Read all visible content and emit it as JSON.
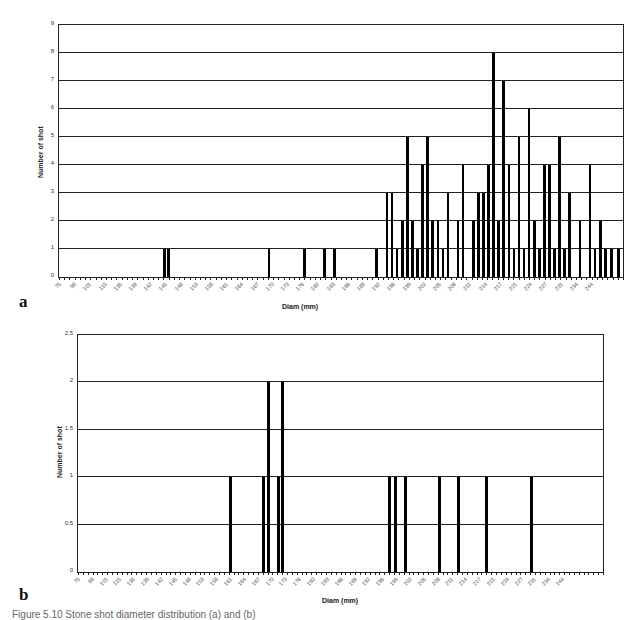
{
  "figure": {
    "caption": "Figure 5.10 Stone shot diameter distribution (a) and (b)"
  },
  "chart_data": [
    {
      "panel": "a",
      "type": "bar",
      "title": "",
      "xlabel": "Diam (mm)",
      "ylabel": "Number of shot",
      "ylim": [
        0,
        9
      ],
      "yticks": [
        "0",
        "1",
        "2",
        "3",
        "4",
        "5",
        "6",
        "7",
        "8",
        "9"
      ],
      "grid": true,
      "xtick_labels": [
        "75",
        "98",
        "101",
        "115",
        "135",
        "139",
        "142",
        "145",
        "148",
        "153",
        "158",
        "161",
        "164",
        "167",
        "170",
        "173",
        "176",
        "180",
        "183",
        "186",
        "189",
        "192",
        "196",
        "199",
        "202",
        "205",
        "208",
        "211",
        "214",
        "217",
        "221",
        "224",
        "227",
        "231",
        "234",
        "244"
      ],
      "bars": [
        {
          "pos": 0.187,
          "value": 1
        },
        {
          "pos": 0.195,
          "value": 1
        },
        {
          "pos": 0.373,
          "value": 1
        },
        {
          "pos": 0.436,
          "value": 1
        },
        {
          "pos": 0.471,
          "value": 1
        },
        {
          "pos": 0.489,
          "value": 1
        },
        {
          "pos": 0.563,
          "value": 1
        },
        {
          "pos": 0.582,
          "value": 3
        },
        {
          "pos": 0.591,
          "value": 3
        },
        {
          "pos": 0.6,
          "value": 1
        },
        {
          "pos": 0.609,
          "value": 2
        },
        {
          "pos": 0.618,
          "value": 5
        },
        {
          "pos": 0.627,
          "value": 2
        },
        {
          "pos": 0.636,
          "value": 1
        },
        {
          "pos": 0.645,
          "value": 4
        },
        {
          "pos": 0.654,
          "value": 5
        },
        {
          "pos": 0.663,
          "value": 2
        },
        {
          "pos": 0.672,
          "value": 2
        },
        {
          "pos": 0.681,
          "value": 1
        },
        {
          "pos": 0.69,
          "value": 3
        },
        {
          "pos": 0.708,
          "value": 2
        },
        {
          "pos": 0.717,
          "value": 4
        },
        {
          "pos": 0.735,
          "value": 2
        },
        {
          "pos": 0.744,
          "value": 3
        },
        {
          "pos": 0.753,
          "value": 3
        },
        {
          "pos": 0.762,
          "value": 4
        },
        {
          "pos": 0.771,
          "value": 8
        },
        {
          "pos": 0.78,
          "value": 2
        },
        {
          "pos": 0.789,
          "value": 7
        },
        {
          "pos": 0.798,
          "value": 4
        },
        {
          "pos": 0.807,
          "value": 1
        },
        {
          "pos": 0.816,
          "value": 5
        },
        {
          "pos": 0.825,
          "value": 1
        },
        {
          "pos": 0.834,
          "value": 6
        },
        {
          "pos": 0.843,
          "value": 2
        },
        {
          "pos": 0.852,
          "value": 1
        },
        {
          "pos": 0.861,
          "value": 4
        },
        {
          "pos": 0.87,
          "value": 4
        },
        {
          "pos": 0.879,
          "value": 1
        },
        {
          "pos": 0.888,
          "value": 5
        },
        {
          "pos": 0.897,
          "value": 1
        },
        {
          "pos": 0.906,
          "value": 3
        },
        {
          "pos": 0.924,
          "value": 2
        },
        {
          "pos": 0.942,
          "value": 4
        },
        {
          "pos": 0.951,
          "value": 1
        },
        {
          "pos": 0.96,
          "value": 2
        },
        {
          "pos": 0.969,
          "value": 1
        },
        {
          "pos": 0.98,
          "value": 1
        },
        {
          "pos": 0.992,
          "value": 1
        }
      ]
    },
    {
      "panel": "b",
      "type": "bar",
      "title": "",
      "xlabel": "Diam (mm)",
      "ylabel": "Number of shot",
      "ylim": [
        0,
        2.5
      ],
      "yticks": [
        "0",
        "0.5",
        "1",
        "1.5",
        "2",
        "2.5"
      ],
      "grid": true,
      "xtick_labels": [
        "75",
        "98",
        "101",
        "115",
        "135",
        "139",
        "142",
        "145",
        "148",
        "153",
        "158",
        "161",
        "164",
        "167",
        "170",
        "173",
        "176",
        "180",
        "183",
        "186",
        "189",
        "192",
        "196",
        "199",
        "202",
        "205",
        "208",
        "211",
        "214",
        "217",
        "221",
        "224",
        "227",
        "231",
        "234",
        "244"
      ],
      "bars": [
        {
          "pos": 0.291,
          "value": 1
        },
        {
          "pos": 0.354,
          "value": 1
        },
        {
          "pos": 0.363,
          "value": 2
        },
        {
          "pos": 0.382,
          "value": 1
        },
        {
          "pos": 0.39,
          "value": 2
        },
        {
          "pos": 0.593,
          "value": 1
        },
        {
          "pos": 0.605,
          "value": 1
        },
        {
          "pos": 0.624,
          "value": 1
        },
        {
          "pos": 0.688,
          "value": 1
        },
        {
          "pos": 0.724,
          "value": 1
        },
        {
          "pos": 0.779,
          "value": 1
        },
        {
          "pos": 0.863,
          "value": 1
        }
      ]
    }
  ],
  "labels": {
    "panel_a": "a",
    "panel_b": "b"
  }
}
